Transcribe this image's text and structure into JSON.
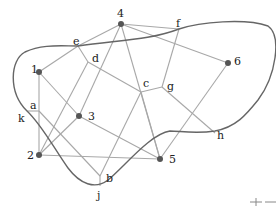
{
  "diagram": {
    "type": "graph-with-closed-curve",
    "colors": {
      "edge": "#a8a8a8",
      "boundary": "#666666",
      "node": "#555555",
      "label": "#222222"
    },
    "nodes": [
      {
        "id": "4",
        "label": "4",
        "x": 121,
        "y": 24,
        "dot": true,
        "lx": 117,
        "ly": 17
      },
      {
        "id": "1",
        "label": "1",
        "x": 39,
        "y": 72,
        "dot": true,
        "lx": 31,
        "ly": 73
      },
      {
        "id": "6",
        "label": "6",
        "x": 228,
        "y": 63,
        "dot": true,
        "lx": 234,
        "ly": 65
      },
      {
        "id": "3",
        "label": "3",
        "x": 79,
        "y": 116,
        "dot": true,
        "lx": 88,
        "ly": 120
      },
      {
        "id": "2",
        "label": "2",
        "x": 39,
        "y": 155,
        "dot": true,
        "lx": 27,
        "ly": 159
      },
      {
        "id": "5",
        "label": "5",
        "x": 160,
        "y": 159,
        "dot": true,
        "lx": 169,
        "ly": 163
      },
      {
        "id": "e",
        "label": "e",
        "x": 78,
        "y": 46,
        "dot": false,
        "lx": 73,
        "ly": 45
      },
      {
        "id": "d",
        "label": "d",
        "x": 88,
        "y": 62,
        "dot": false,
        "lx": 92,
        "ly": 62
      },
      {
        "id": "f",
        "label": "f",
        "x": 179,
        "y": 29,
        "dot": false,
        "lx": 176,
        "ly": 27
      },
      {
        "id": "c",
        "label": "c",
        "x": 141,
        "y": 92,
        "dot": false,
        "lx": 143,
        "ly": 87
      },
      {
        "id": "g",
        "label": "g",
        "x": 162,
        "y": 87,
        "dot": false,
        "lx": 167,
        "ly": 90
      },
      {
        "id": "h",
        "label": "h",
        "x": 215,
        "y": 133,
        "dot": false,
        "lx": 217,
        "ly": 139
      },
      {
        "id": "a",
        "label": "a",
        "x": 39,
        "y": 111,
        "dot": false,
        "lx": 30,
        "ly": 109
      },
      {
        "id": "k",
        "label": "k",
        "x": 27,
        "y": 111,
        "dot": false,
        "lx": 18,
        "ly": 122
      },
      {
        "id": "b",
        "label": "b",
        "x": 100,
        "y": 176,
        "dot": false,
        "lx": 106,
        "ly": 182
      },
      {
        "id": "j",
        "label": "j",
        "x": 100,
        "y": 186,
        "dot": false,
        "lx": 97,
        "ly": 199
      }
    ],
    "edges": [
      [
        "4",
        "e"
      ],
      [
        "4",
        "f"
      ],
      [
        "4",
        "3"
      ],
      [
        "4",
        "5"
      ],
      [
        "e",
        "1"
      ],
      [
        "e",
        "d"
      ],
      [
        "d",
        "c"
      ],
      [
        "d",
        "2"
      ],
      [
        "1",
        "a"
      ],
      [
        "1",
        "3"
      ],
      [
        "a",
        "2"
      ],
      [
        "a",
        "k"
      ],
      [
        "a",
        "b"
      ],
      [
        "2",
        "5"
      ],
      [
        "3",
        "2"
      ],
      [
        "3",
        "5"
      ],
      [
        "b",
        "j"
      ],
      [
        "b",
        "c"
      ],
      [
        "c",
        "g"
      ],
      [
        "c",
        "5"
      ],
      [
        "g",
        "f"
      ],
      [
        "g",
        "h"
      ],
      [
        "6",
        "5"
      ],
      [
        "6",
        "e2"
      ]
    ],
    "extra_edges": [
      {
        "from": "4",
        "to": "6",
        "x1": 121,
        "y1": 24,
        "x2": 228,
        "y2": 63
      }
    ],
    "boundary_path": "M 78 46 C 120 40, 150 40, 179 29 C 200 22, 245 18, 268 26 C 282 36, 276 76, 258 100 C 246 115, 236 127, 215 131 C 195 134, 180 131, 170 131 C 150 134, 125 166, 108 180 C 95 190, 80 184, 68 168 C 55 150, 42 125, 27 111 C 8 92, 10 60, 25 52 C 42 44, 60 46, 78 46 Z",
    "corner_mark": {
      "x": 258,
      "y": 203,
      "text": "+"
    }
  }
}
